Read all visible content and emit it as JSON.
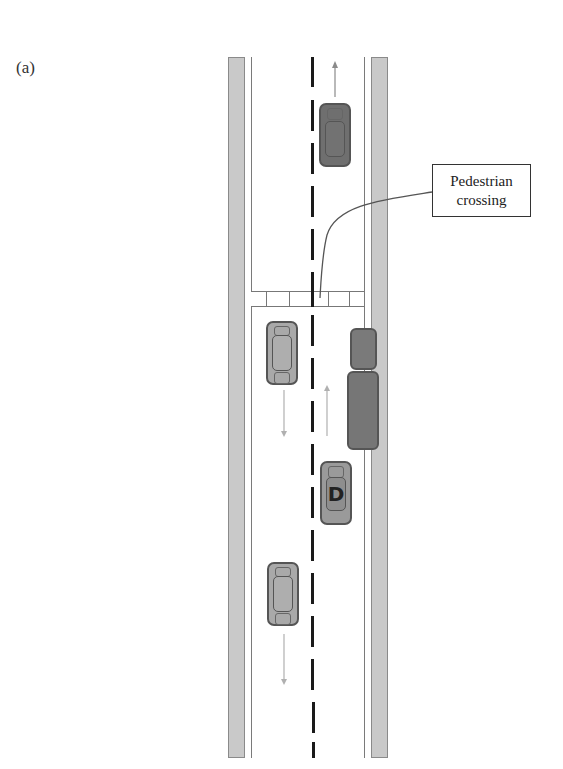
{
  "figure": {
    "panel_label": "(a)",
    "callout": {
      "line1": "Pedestrian",
      "line2": "crossing"
    },
    "vehicles": [
      {
        "id": "car-top-oncoming",
        "lane": "right",
        "direction": "up",
        "color": "#6f6f6f",
        "label": ""
      },
      {
        "id": "car-left-1",
        "lane": "left",
        "direction": "down",
        "color": "#a9a9a9",
        "label": ""
      },
      {
        "id": "truck",
        "lane": "right-edge",
        "direction": "parked",
        "color": "#767676",
        "label": ""
      },
      {
        "id": "car-driver",
        "lane": "right",
        "direction": "up",
        "color": "#9a9a9a",
        "label": "D"
      },
      {
        "id": "car-left-2",
        "lane": "left",
        "direction": "down",
        "color": "#a9a9a9",
        "label": ""
      }
    ],
    "colors": {
      "curb": "#c9c9c9",
      "center_dash": "#1a1a1a",
      "arrow": "#9a9a9a"
    }
  }
}
